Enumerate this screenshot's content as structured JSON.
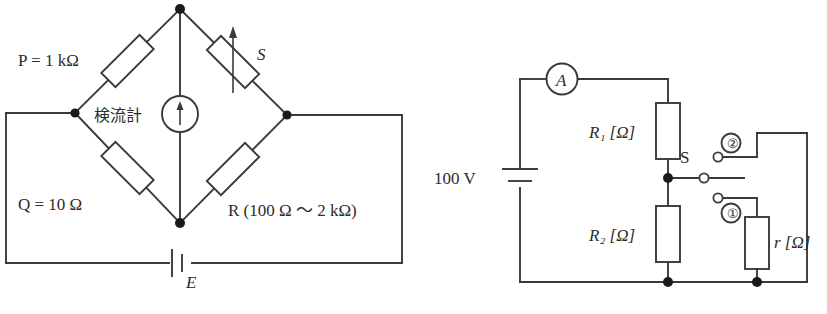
{
  "figure": {
    "line_color": "#3a3a3a",
    "node_color": "#1a1a1a",
    "background": "#ffffff"
  },
  "left_circuit": {
    "name": "wheatstone-bridge",
    "labels": {
      "p": "P = 1 kΩ",
      "q": "Q = 10 Ω",
      "s": "S",
      "r": "R (100 Ω ～ 2 kΩ)",
      "galvanometer": "検流計",
      "battery": "E"
    },
    "components": [
      {
        "id": "P",
        "type": "resistor",
        "label": "P = 1 kΩ",
        "variable": false
      },
      {
        "id": "S",
        "type": "variable-resistor",
        "label": "S",
        "variable": true
      },
      {
        "id": "Q",
        "type": "resistor",
        "label": "Q = 10 Ω",
        "variable": false
      },
      {
        "id": "R",
        "type": "resistor",
        "label": "R (100 Ω ～ 2 kΩ)",
        "variable": false
      },
      {
        "id": "G",
        "type": "galvanometer",
        "label": "検流計",
        "variable": false
      },
      {
        "id": "E",
        "type": "battery",
        "label": "E",
        "variable": false
      }
    ]
  },
  "right_circuit": {
    "name": "ammeter-divider-circuit",
    "labels": {
      "source": "100 V",
      "ammeter": "A",
      "r1": "R₁ [Ω]",
      "r2": "R₂ [Ω]",
      "r_small": "r [Ω]",
      "switch": "S",
      "terminal_one": "①",
      "terminal_two": "②"
    },
    "components": [
      {
        "id": "V",
        "type": "battery",
        "label": "100 V"
      },
      {
        "id": "A",
        "type": "ammeter",
        "label": "A"
      },
      {
        "id": "R1",
        "type": "resistor",
        "label": "R₁ [Ω]"
      },
      {
        "id": "R2",
        "type": "resistor",
        "label": "R₂ [Ω]"
      },
      {
        "id": "r",
        "type": "resistor",
        "label": "r [Ω]"
      },
      {
        "id": "S",
        "type": "switch",
        "label": "S",
        "positions": [
          "①",
          "②"
        ]
      }
    ]
  }
}
